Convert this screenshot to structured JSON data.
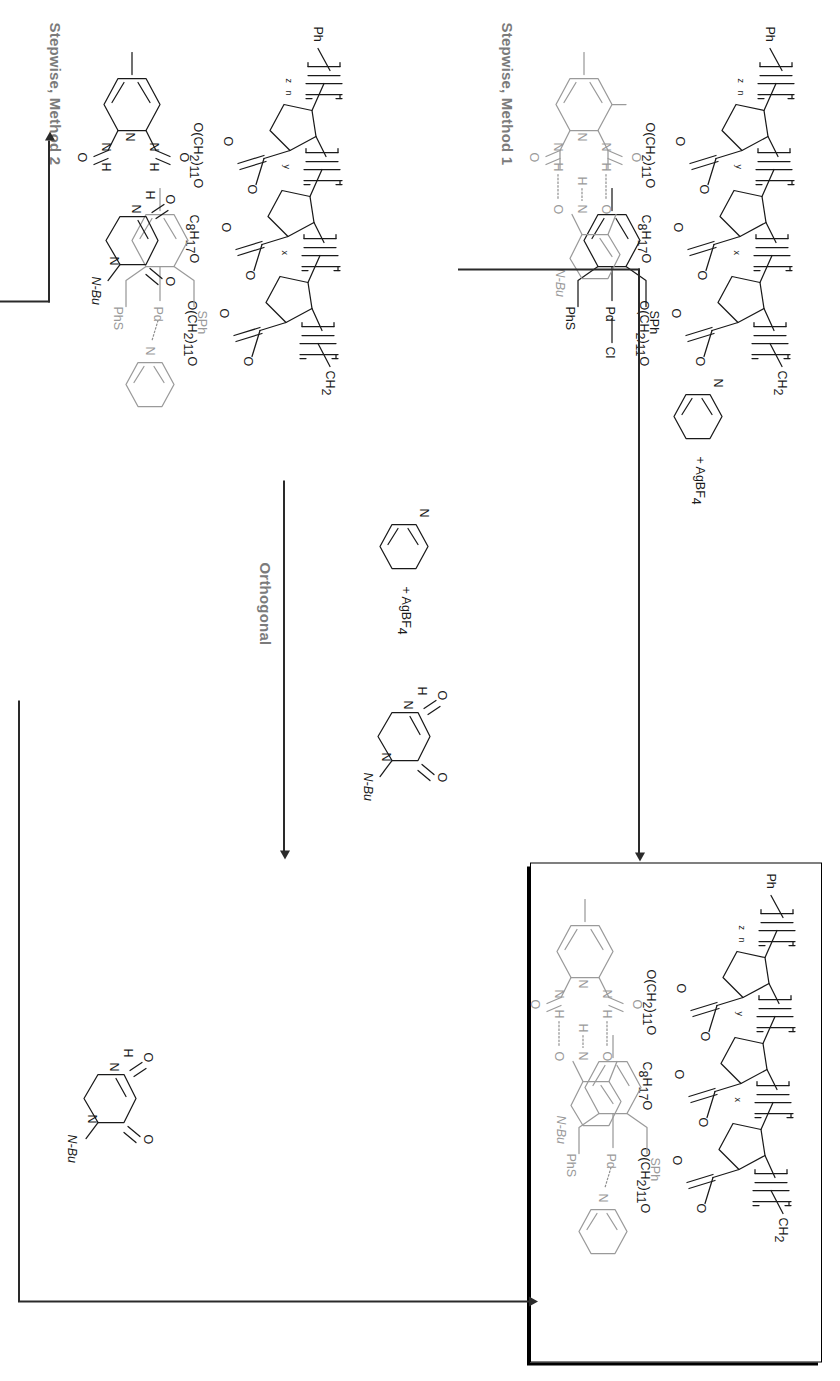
{
  "figure": {
    "type": "reaction-scheme",
    "orientation": "rotated-90-clockwise"
  },
  "route_labels": {
    "method1": "Stepwise, Method 1",
    "method2": "Stepwise, Method 2",
    "orthogonal": "Orthogonal"
  },
  "reagents": {
    "pyridine_silver": "+ AgBF",
    "pyridine_silver_sub": "4",
    "pyridine_atom": "N",
    "thymine_nbu": "N-Bu",
    "thymine_nh": "H",
    "thymine_n": "N",
    "thymine_o": "O"
  },
  "polymer": {
    "end_group": "Ph",
    "terminus": "CH",
    "terminus_sub": "2",
    "block_x": "x",
    "block_y": "y",
    "block_z": "z",
    "block_n": "n",
    "ester_o": "O",
    "spacer_11": "O(CH",
    "spacer_11_sub": "2",
    "spacer_11_tail": ")",
    "spacer_11_tail_sub": "11",
    "spacer_11_end": "O",
    "octyl": "C",
    "octyl_sub1": "8",
    "octyl_h": "H",
    "octyl_sub2": "17",
    "octyl_o": "O",
    "carbonyl": "O"
  },
  "pincer": {
    "metal": "Pd",
    "thioether_right": "SPh",
    "thioether_left": "PhS",
    "chloride": "Cl",
    "pyridine_n": "N"
  },
  "recognition": {
    "amide_n": "N",
    "amide_h": "H",
    "pyridine_n": "N",
    "carbonyl_o": "O",
    "thymine_n": "N",
    "thymine_nbu": "N-Bu",
    "thymine_o": "O"
  },
  "boxes": {
    "product_caption": "",
    "starting_caption": ""
  },
  "colors": {
    "ink": "#1a1a1a",
    "grey_ink": "#9a9a9a",
    "label_grey": "#7b7b7b",
    "box_border": "#000000"
  }
}
